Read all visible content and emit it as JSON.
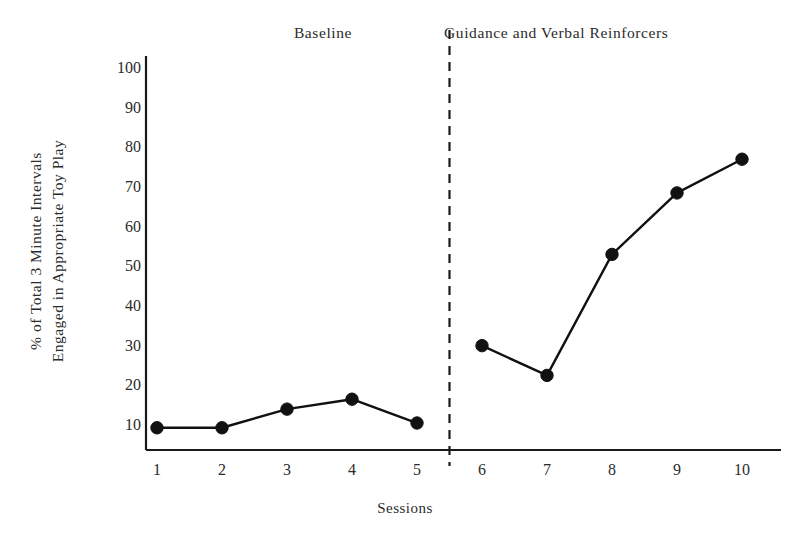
{
  "chart_data": {
    "type": "line",
    "title": "",
    "xlabel": "Sessions",
    "ylabel": "% of Total 3 Minute Intervals Engaged in Appropriate Toy Play",
    "ylabel_lines": [
      "% of Total 3 Minute Intervals",
      "Engaged in Appropriate Toy Play"
    ],
    "x": [
      1,
      2,
      3,
      4,
      5,
      6,
      7,
      8,
      9,
      10
    ],
    "xtick_labels": [
      "1",
      "2",
      "3",
      "4",
      "5",
      "6",
      "7",
      "8",
      "9",
      "10"
    ],
    "ytick_labels": [
      "10",
      "20",
      "30",
      "40",
      "50",
      "60",
      "70",
      "80",
      "90",
      "100"
    ],
    "ytick_values": [
      10,
      20,
      30,
      40,
      50,
      60,
      70,
      80,
      90,
      100
    ],
    "ylim": [
      0,
      105
    ],
    "xlim": [
      0.45,
      10.9
    ],
    "grid": false,
    "legend": "none",
    "marker": "filled-circle",
    "line_color": "#111111",
    "marker_color": "#111111",
    "background": "#ffffff",
    "series": [
      {
        "name": "Baseline",
        "x": [
          1,
          2,
          3,
          4,
          5
        ],
        "values": [
          9.3,
          9.3,
          14.0,
          16.5,
          10.5
        ]
      },
      {
        "name": "Guidance and Verbal Reinforcers",
        "x": [
          6,
          7,
          8,
          9,
          10
        ],
        "values": [
          30.0,
          22.5,
          53.0,
          68.5,
          77.0
        ]
      }
    ],
    "phases": [
      {
        "name": "Baseline",
        "label": "Baseline",
        "sessions": [
          1,
          5
        ]
      },
      {
        "name": "Treatment",
        "label": "Guidance and Verbal Reinforcers",
        "sessions": [
          6,
          10
        ]
      }
    ],
    "phase_change_line": {
      "style": "dashed",
      "between_sessions": [
        5,
        6
      ],
      "color": "#1a1a1a"
    },
    "annotations": []
  }
}
